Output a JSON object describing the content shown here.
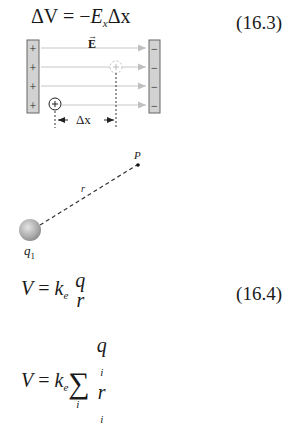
{
  "equations": [
    {
      "id": "16.3",
      "lhs": "ΔV",
      "rhs_sign": "= −",
      "E": "E",
      "E_sub": "x",
      "dx": "Δx",
      "number": "(16.3)"
    },
    {
      "id": "16.4",
      "lhs": "V",
      "eq": "=",
      "k": "k",
      "k_sub": "e",
      "num": "q",
      "den": "r",
      "number": "(16.4)"
    },
    {
      "id": "sum",
      "lhs": "V",
      "eq": "=",
      "k": "k",
      "k_sub": "e",
      "sum": "∑",
      "sum_index": "i",
      "num": "q",
      "num_sub": "i",
      "den": "r",
      "den_sub": "i"
    }
  ],
  "diagram_field": {
    "field_label": "E",
    "plus_sign": "+",
    "minus_sign": "−",
    "displacement_label": "Δx",
    "colors": {
      "plate_fill": "#d2d2d2",
      "plate_border": "#666666",
      "field_line": "#c8c8c8",
      "ghost": "#bbbbbb"
    }
  },
  "diagram_point": {
    "charge_label": "q",
    "charge_sub": "1",
    "distance_label": "r",
    "point_label": "P"
  }
}
